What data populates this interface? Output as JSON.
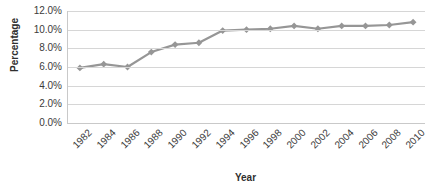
{
  "chart_data": {
    "type": "line",
    "title": "",
    "xlabel": "Year",
    "ylabel": "Percentage",
    "categories": [
      "1982",
      "1984",
      "1986",
      "1988",
      "1990",
      "1992",
      "1994",
      "1996",
      "1998",
      "2000",
      "2002",
      "2004",
      "2006",
      "2008",
      "2010"
    ],
    "values": [
      5.9,
      6.3,
      6.0,
      7.6,
      8.4,
      8.6,
      9.9,
      10.0,
      10.1,
      10.4,
      10.1,
      10.4,
      10.4,
      10.5,
      10.8
    ],
    "series": [
      {
        "name": "Percentage",
        "values": [
          5.9,
          6.3,
          6.0,
          7.6,
          8.4,
          8.6,
          9.9,
          10.0,
          10.1,
          10.4,
          10.1,
          10.4,
          10.4,
          10.5,
          10.8
        ],
        "color": "#969696",
        "marker": "diamond"
      }
    ],
    "ylim": [
      0,
      12
    ],
    "ytick_values": [
      12,
      10,
      8,
      6,
      4,
      2,
      0
    ],
    "ytick_labels": [
      "12.0%",
      "10.0%",
      "8.0%",
      "6.0%",
      "4.0%",
      "2.0%",
      "0.0%"
    ],
    "xtick_labels": [
      "1982",
      "1984",
      "1986",
      "1988",
      "1990",
      "1992",
      "1994",
      "1996",
      "1998",
      "2000",
      "2002",
      "2004",
      "2006",
      "2008",
      "2010"
    ],
    "xtick_rotation": -45,
    "grid": "horizontal",
    "legend": "none",
    "value_suffix": "%"
  },
  "axes": {
    "y_title": "Percentage",
    "x_title": "Year"
  },
  "colors": {
    "series": "#969696",
    "gridline": "#d6d6d6",
    "axis_line": "#c9c9c9",
    "background": "#ffffff",
    "text": "#3b3b3b"
  }
}
